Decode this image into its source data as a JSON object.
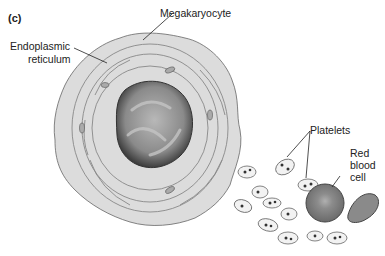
{
  "panel_label": "(c)",
  "labels": {
    "megakaryocyte": "Megakaryocyte",
    "er_line1": "Endoplasmic",
    "er_line2": "reticulum",
    "platelets": "Platelets",
    "rbc_line1": "Red",
    "rbc_line2": "blood",
    "rbc_line3": "cell"
  },
  "colors": {
    "cytoplasm": "#dcdcdc",
    "nucleus_dark": "#4a4a4a",
    "nucleus_light": "#a8a8a8",
    "rbc": "#8a8a8a",
    "outline": "#555555"
  }
}
